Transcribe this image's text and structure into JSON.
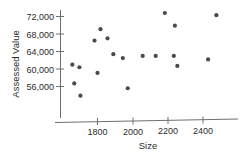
{
  "chart_data": {
    "type": "scatter",
    "title": "",
    "xlabel": "Size",
    "ylabel": "Assessed Value",
    "xlim": [
      1640,
      2530
    ],
    "ylim": [
      53200,
      73400
    ],
    "xticks": [
      1800,
      2000,
      2200,
      2400
    ],
    "xtick_labels": [
      "1800",
      "2000",
      "2200",
      "2400"
    ],
    "yticks": [
      56000,
      60000,
      64000,
      68000,
      72000
    ],
    "ytick_labels": [
      "56,000",
      "60,000",
      "64,000",
      "68,000",
      "72,000"
    ],
    "grid": false,
    "legend": false,
    "marker_color": "#4a4a52",
    "axis_color": "#6f6f6f",
    "text_color": "#2b2b2b",
    "points": [
      {
        "x": 1783,
        "y": 66500
      },
      {
        "x": 1817,
        "y": 69100
      },
      {
        "x": 1800,
        "y": 59100
      },
      {
        "x": 1657,
        "y": 61000
      },
      {
        "x": 1697,
        "y": 60400
      },
      {
        "x": 1668,
        "y": 56700
      },
      {
        "x": 1703,
        "y": 53900
      },
      {
        "x": 1857,
        "y": 67000
      },
      {
        "x": 1890,
        "y": 63400
      },
      {
        "x": 1944,
        "y": 62500
      },
      {
        "x": 2057,
        "y": 63000
      },
      {
        "x": 2131,
        "y": 63000
      },
      {
        "x": 1972,
        "y": 55600
      },
      {
        "x": 2183,
        "y": 72800
      },
      {
        "x": 2240,
        "y": 69900
      },
      {
        "x": 2234,
        "y": 63000
      },
      {
        "x": 2254,
        "y": 60700
      },
      {
        "x": 2429,
        "y": 62200
      },
      {
        "x": 2476,
        "y": 72300
      }
    ]
  },
  "axis": {
    "y_title": "Assessed Value",
    "x_title": "Size"
  }
}
